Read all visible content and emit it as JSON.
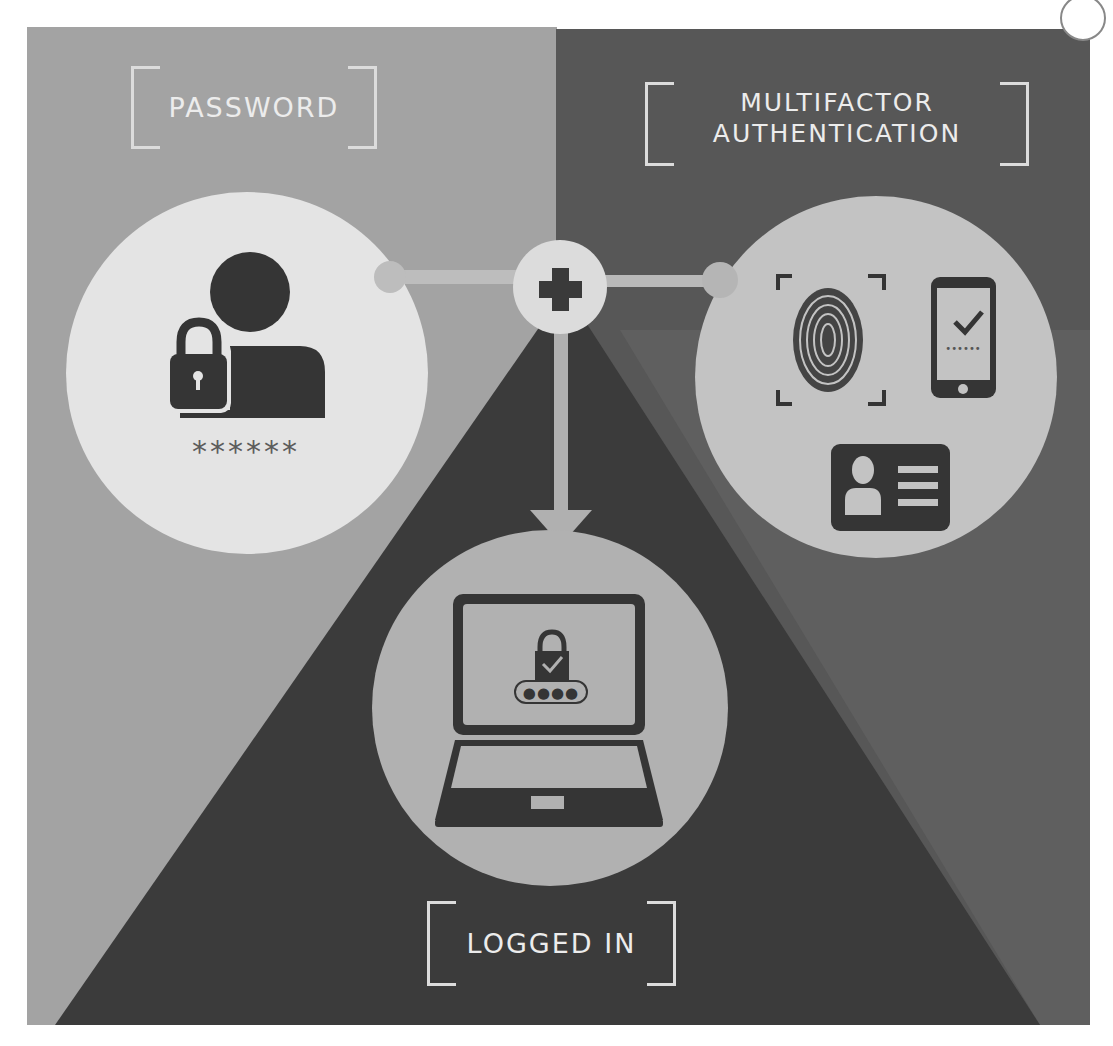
{
  "labels": {
    "password": "PASSWORD",
    "mfa_line1": "MULTIFACTOR",
    "mfa_line2": "AUTHENTICATION",
    "logged_in": "LOGGED IN"
  },
  "password_circle": {
    "mask": "******",
    "icons": [
      "user-icon",
      "padlock-icon"
    ]
  },
  "mfa_circle": {
    "icons": [
      "fingerprint-scan-icon",
      "smartphone-check-icon",
      "id-card-icon"
    ],
    "phone_code_mask": "••••••"
  },
  "connector": {
    "icon": "plus-icon"
  },
  "laptop_circle": {
    "icons": [
      "laptop-icon",
      "padlock-check-icon"
    ],
    "pin_mask": "●●●●"
  },
  "colors": {
    "left_bg": "#a3a3a3",
    "right_bg": "#575757",
    "right_outer": "#5f5f5f",
    "center_triangle": "#3b3b3b",
    "password_circle": "#e4e4e4",
    "mfa_circle": "#c3c3c3",
    "laptop_circle": "#b1b1b1",
    "icon_dark": "#353535",
    "label_text": "#ececec"
  }
}
